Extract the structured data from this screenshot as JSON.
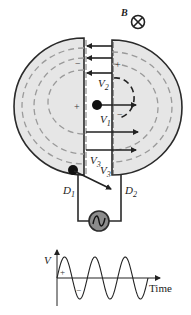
{
  "diagram": {
    "magnetic_field": {
      "label": "B",
      "direction": "into page",
      "symbol": "circle-cross"
    },
    "dees": [
      {
        "id": "D1",
        "label_main": "D",
        "label_sub": "1",
        "side": "left"
      },
      {
        "id": "D2",
        "label_main": "D",
        "label_sub": "2",
        "side": "right"
      }
    ],
    "velocities": [
      {
        "label_main": "V",
        "label_sub": "1"
      },
      {
        "label_main": "V",
        "label_sub": "2"
      },
      {
        "label_main": "V",
        "label_sub": "3"
      },
      {
        "label_main": "V",
        "label_sub": "3"
      }
    ],
    "charge_signs": {
      "left_dee": "+",
      "right_top": "+",
      "right_bottom": "−",
      "left_top": "−"
    },
    "source": {
      "name": "AC oscillator",
      "symbol": "sine-wave"
    },
    "colors": {
      "dee_fill": "#e6e6e6",
      "outline": "#2a2a2a",
      "dashed_path": "#9a9a9a",
      "source_fill": "#8c8c8c"
    }
  },
  "graph": {
    "y_label": "V",
    "x_label": "Time",
    "plus": "+",
    "minus": "−",
    "cycles": 3
  }
}
